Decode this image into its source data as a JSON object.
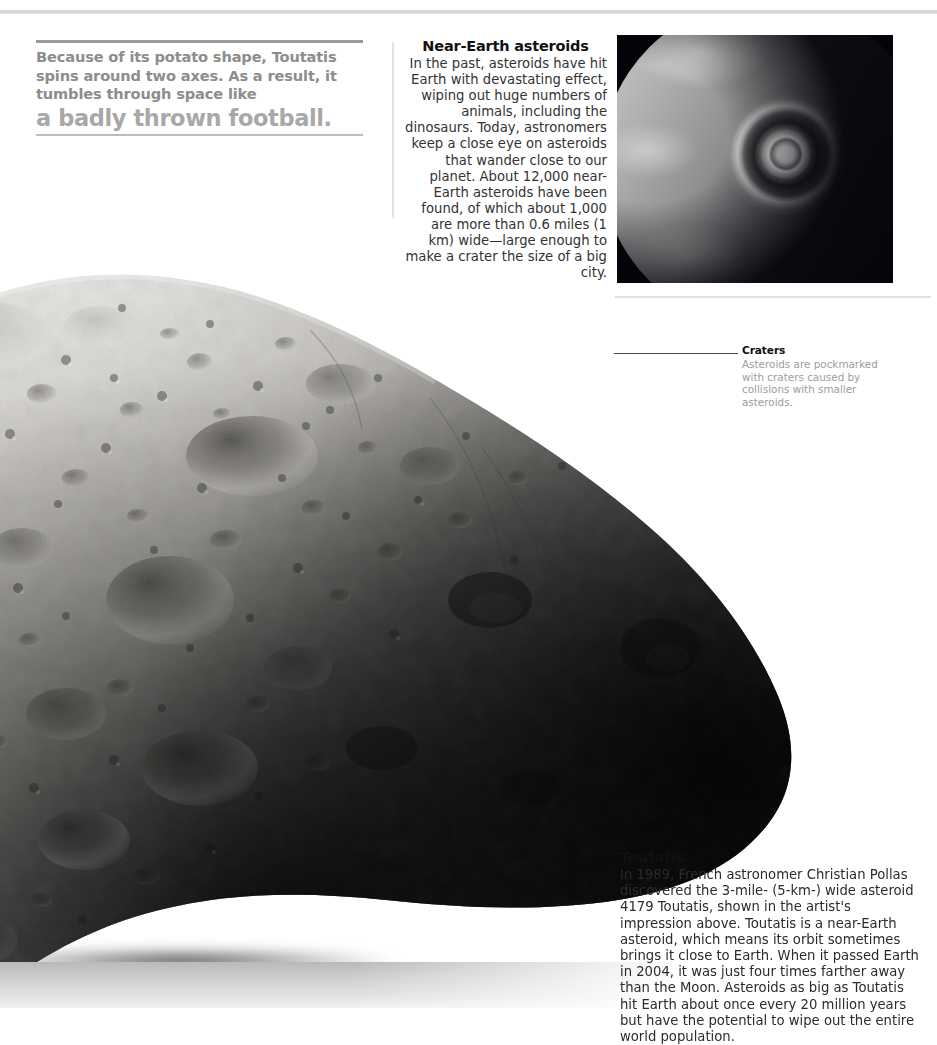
{
  "page": {
    "background_color": "#ffffff",
    "top_rule_color": "#d8d8d8"
  },
  "headline": {
    "lede": "Because of its potato shape, Toutatis spins around two axes. As a result, it tumbles through space like",
    "kicker": "a badly thrown football.",
    "lede_color": "#8d8d8d",
    "kicker_color": "#a8a8a8",
    "rule_top_color": "#9a9a9a",
    "rule_bottom_color": "#bdbdbd"
  },
  "near_earth": {
    "title": "Near-Earth asteroids",
    "body": "In the past, asteroids have hit Earth with devastating effect, wiping out huge numbers of animals, including the dinosaurs. Today, astronomers keep a close eye on asteroids that wander close to our planet. About 12,000 near-Earth asteroids have been found, of which about 1,000 are more than 0.6 miles (1 km) wide—large enough to make a crater the size of a big city.",
    "align": "right"
  },
  "earth_photo": {
    "alt": "Grayscale photograph of Earth from space showing a massive impact explosion with concentric shock rings",
    "space_color": "#05060a",
    "flash_color": "#ffffff"
  },
  "craters": {
    "title": "Craters",
    "body": "Asteroids are pockmarked with craters caused by collisions with smaller asteroids.",
    "body_color": "#9d9d9d",
    "leader_color": "#4a4a4a"
  },
  "toutatis": {
    "title": "Toutatis",
    "body": "In 1989, French astronomer Christian Pollas discovered the 3-mile- (5-km-) wide asteroid 4179 Toutatis, shown in the artist's impression above. Toutatis is a near-Earth asteroid, which means its orbit sometimes brings it close to Earth. When it passed Earth in 2004, it was just four times farther away than the Moon. Asteroids as big as Toutatis hit Earth about once every 20 million years but have the potential to wipe out the entire world population."
  },
  "asteroid": {
    "alt": "Artist's impression of asteroid 4179 Toutatis — a large elongated potato-shaped grey rock covered in craters, lit from the upper left and fading into deep shadow at lower right",
    "lit_color": "#d8d6d2",
    "mid_color": "#8e8c88",
    "shadow_color": "#0b0b0c"
  }
}
